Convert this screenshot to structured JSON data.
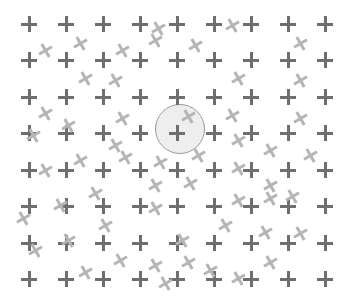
{
  "stimulus": {
    "width": 350,
    "height": 307,
    "background": "#ffffff",
    "grid": {
      "columns_x": [
        29,
        66,
        103,
        140,
        177,
        214,
        251,
        288,
        325
      ],
      "rows_y": [
        24,
        60,
        97,
        133,
        170,
        206,
        243,
        279
      ],
      "color": "#6e6e6e"
    },
    "highlight_circle": {
      "cx": 180,
      "cy": 129,
      "r": 25,
      "fill": "#eeeeee",
      "stroke": "#9a9a9a"
    },
    "distractors": {
      "color": "#b5b5b5",
      "items": [
        {
          "x": 45,
          "y": 50,
          "rot": -30
        },
        {
          "x": 80,
          "y": 43,
          "rot": -30
        },
        {
          "x": 122,
          "y": 50,
          "rot": -30
        },
        {
          "x": 155,
          "y": 40,
          "rot": -30
        },
        {
          "x": 195,
          "y": 45,
          "rot": -30
        },
        {
          "x": 232,
          "y": 25,
          "rot": -30
        },
        {
          "x": 300,
          "y": 43,
          "rot": -30
        },
        {
          "x": 158,
          "y": 28,
          "rot": -30
        },
        {
          "x": 85,
          "y": 78,
          "rot": -30
        },
        {
          "x": 115,
          "y": 80,
          "rot": -30
        },
        {
          "x": 238,
          "y": 78,
          "rot": -30
        },
        {
          "x": 300,
          "y": 80,
          "rot": -30
        },
        {
          "x": 45,
          "y": 113,
          "rot": -30
        },
        {
          "x": 68,
          "y": 125,
          "rot": -30
        },
        {
          "x": 122,
          "y": 118,
          "rot": -30
        },
        {
          "x": 232,
          "y": 115,
          "rot": -30
        },
        {
          "x": 300,
          "y": 118,
          "rot": -30
        },
        {
          "x": 188,
          "y": 116,
          "rot": -30
        },
        {
          "x": 33,
          "y": 135,
          "rot": -30
        },
        {
          "x": 115,
          "y": 145,
          "rot": -30
        },
        {
          "x": 238,
          "y": 140,
          "rot": -30
        },
        {
          "x": 270,
          "y": 150,
          "rot": -30
        },
        {
          "x": 198,
          "y": 155,
          "rot": -30
        },
        {
          "x": 160,
          "y": 162,
          "rot": -30
        },
        {
          "x": 310,
          "y": 155,
          "rot": -30
        },
        {
          "x": 45,
          "y": 170,
          "rot": -30
        },
        {
          "x": 80,
          "y": 160,
          "rot": -30
        },
        {
          "x": 155,
          "y": 185,
          "rot": -30
        },
        {
          "x": 190,
          "y": 183,
          "rot": -30
        },
        {
          "x": 238,
          "y": 168,
          "rot": -30
        },
        {
          "x": 270,
          "y": 185,
          "rot": -30
        },
        {
          "x": 125,
          "y": 157,
          "rot": -30
        },
        {
          "x": 95,
          "y": 193,
          "rot": -30
        },
        {
          "x": 60,
          "y": 205,
          "rot": -30
        },
        {
          "x": 23,
          "y": 218,
          "rot": -30
        },
        {
          "x": 292,
          "y": 196,
          "rot": -30
        },
        {
          "x": 270,
          "y": 198,
          "rot": -30
        },
        {
          "x": 238,
          "y": 200,
          "rot": -30
        },
        {
          "x": 155,
          "y": 208,
          "rot": -30
        },
        {
          "x": 105,
          "y": 225,
          "rot": -30
        },
        {
          "x": 68,
          "y": 240,
          "rot": -30
        },
        {
          "x": 35,
          "y": 250,
          "rot": -30
        },
        {
          "x": 225,
          "y": 225,
          "rot": -30
        },
        {
          "x": 265,
          "y": 232,
          "rot": -30
        },
        {
          "x": 182,
          "y": 240,
          "rot": -30
        },
        {
          "x": 300,
          "y": 233,
          "rot": -30
        },
        {
          "x": 120,
          "y": 260,
          "rot": -30
        },
        {
          "x": 155,
          "y": 265,
          "rot": -30
        },
        {
          "x": 85,
          "y": 272,
          "rot": -30
        },
        {
          "x": 188,
          "y": 262,
          "rot": -30
        },
        {
          "x": 210,
          "y": 270,
          "rot": -30
        },
        {
          "x": 270,
          "y": 262,
          "rot": -30
        },
        {
          "x": 238,
          "y": 278,
          "rot": -30
        },
        {
          "x": 165,
          "y": 283,
          "rot": -30
        }
      ]
    }
  }
}
